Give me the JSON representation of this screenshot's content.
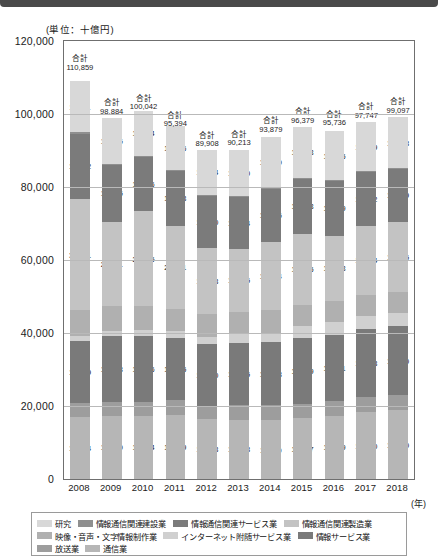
{
  "unit_note": "(単位：十億円)",
  "year_axis_note": "(年)",
  "axis": {
    "y_ticks": [
      "120,000",
      "100,000",
      "80,000",
      "60,000",
      "40,000",
      "20,000",
      "0"
    ],
    "y_min": 0,
    "y_max": 120000,
    "y_step": 20000,
    "x_label": "(年)"
  },
  "legend": {
    "rows": [
      [
        {
          "label": "研究",
          "color": "#d8d8d8"
        },
        {
          "label": "情報通信関連建設業",
          "color": "#8f8f8f"
        },
        {
          "label": "情報通信関連サービス業",
          "color": "#7b7b7b"
        },
        {
          "label": "情報通信関連製造業",
          "color": "#c3c3c3"
        }
      ],
      [
        {
          "label": "映像・音声・文字情報制作業",
          "color": "#b0b0b0"
        },
        {
          "label": "インターネット附随サービス業",
          "color": "#d0d0d0"
        },
        {
          "label": "情報サービス業",
          "color": "#7a7a7a"
        }
      ],
      [
        {
          "label": "放送業",
          "color": "#9d9d9d"
        },
        {
          "label": "通信業",
          "color": "#b6b6b6"
        }
      ]
    ]
  },
  "chart_data": {
    "type": "bar",
    "title": "",
    "subtitle": "",
    "xlabel": "(年)",
    "ylabel": "(単位：十億円)",
    "ylim": [
      0,
      120000
    ],
    "grid": true,
    "stacked": true,
    "legend_position": "bottom",
    "categories": [
      "2008",
      "2009",
      "2010",
      "2011",
      "2012",
      "2013",
      "2014",
      "2015",
      "2016",
      "2017",
      "2018"
    ],
    "totals": [
      110859,
      98884,
      100042,
      95394,
      89908,
      90213,
      93879,
      96379,
      95736,
      97747,
      99097
    ],
    "total_labels": [
      "110,859",
      "98,884",
      "100,042",
      "95,394",
      "89,908",
      "90,213",
      "93,879",
      "96,379",
      "95,736",
      "97,747",
      "99,097"
    ],
    "total_prefix": "合計",
    "series": [
      {
        "name": "通信業",
        "color": "#b6b6b6",
        "values": [
          16934,
          17350,
          17304,
          17669,
          16418,
          16278,
          16110,
          16667,
          17369,
          18340,
          18780
        ],
        "labels": [
          "16,934",
          "17,350",
          "17,304",
          "17,669",
          "16,418",
          "16,278",
          "16,110",
          "16,667",
          "17,369",
          "18,340",
          "18,780"
        ]
      },
      {
        "name": "放送業",
        "color": "#9d9d9d",
        "values": [
          3877,
          3883,
          3899,
          3961,
          3451,
          3953,
          4066,
          3951,
          4099,
          4085,
          4115
        ],
        "labels": [
          "3,877",
          "3,883",
          "3,899",
          "3,961",
          "3,451",
          "3,953",
          "4,066",
          "3,951",
          "4,099",
          "4,085",
          "4,115"
        ]
      },
      {
        "name": "情報サービス業",
        "color": "#7a7a7a",
        "values": [
          16889,
          17943,
          17946,
          16945,
          16990,
          17125,
          17288,
          17999,
          18041,
          18608,
          18980
        ],
        "labels": [
          "16,889",
          "17,943",
          "17,946",
          "16,945",
          "16,990",
          "17,125",
          "17,288",
          "17,999",
          "18,041",
          "18,608",
          "18,980"
        ]
      },
      {
        "name": "インターネット附随サービス業",
        "color": "#d0d0d0",
        "values": [
          1407,
          1429,
          1627,
          1904,
          1935,
          2262,
          2608,
          3232,
          3494,
          3605,
          3725
        ],
        "labels": [
          "1,407",
          "1,429",
          "1,627",
          "1,904",
          "1,935",
          "2,262",
          "2,608",
          "3,232",
          "3,494",
          "3,605",
          "3,725"
        ]
      },
      {
        "name": "映像・音声・文字情報制作業",
        "color": "#b0b0b0",
        "values": [
          7152,
          6837,
          6540,
          6182,
          6304,
          6151,
          6168,
          5867,
          5878,
          5843,
          5574
        ],
        "labels": [
          "7,152",
          "6,837",
          "6,540",
          "6,182",
          "6,304",
          "6,151",
          "6,168",
          "5,867",
          "5,878",
          "5,843",
          "5,574"
        ]
      },
      {
        "name": "情報通信関連製造業",
        "color": "#c3c3c3",
        "values": [
          30391,
          23071,
          26025,
          22741,
          18198,
          17345,
          18584,
          19525,
          17833,
          18964,
          19215
        ],
        "labels": [
          "30,391",
          "23,071",
          "26,025",
          "22,741",
          "18,198",
          "17,345",
          "18,584",
          "19,525",
          "17,833",
          "18,964",
          "19,215"
        ]
      },
      {
        "name": "情報通信関連サービス業",
        "color": "#7b7b7b",
        "values": [
          17982,
          15425,
          15036,
          14943,
          14390,
          14294,
          14826,
          15033,
          15049,
          14712,
          14739
        ],
        "labels": [
          "17,982",
          "15,425",
          "15,036",
          "14,943",
          "14,390",
          "14,294",
          "14,826",
          "15,033",
          "15,049",
          "14,712",
          "14,739"
        ]
      },
      {
        "name": "情報通信関連建設業",
        "color": "#8f8f8f",
        "values": [
          377,
          287,
          250,
          224,
          229,
          254,
          195,
          151,
          167,
          151,
          145
        ],
        "labels": [
          "377",
          "287",
          "250",
          "224",
          "229",
          "254",
          "195",
          "151",
          "167",
          "151",
          "145"
        ]
      },
      {
        "name": "研究",
        "color": "#d8d8d8",
        "values": [
          13911,
          12705,
          12084,
          12126,
          12134,
          12540,
          13790,
          14153,
          13335,
          13409,
          13818
        ],
        "labels": [
          "13,911",
          "12,705",
          "12,084",
          "12,126",
          "12,134",
          "12,540",
          "13,790",
          "14,153",
          "13,335",
          "13,409",
          "13,818"
        ]
      }
    ]
  }
}
